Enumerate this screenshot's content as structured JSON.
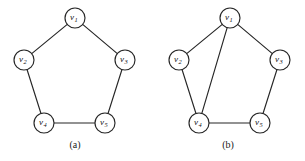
{
  "figure": {
    "background_color": "#ffffff",
    "ink_color": "#262626",
    "node_radius": 10,
    "node_fill": "#ffffff"
  },
  "chart_data": {
    "type": "diagram",
    "title": "",
    "graphs": [
      {
        "id": "a",
        "caption": "(a)",
        "caption_x": 75,
        "caption_y": 148,
        "nodes": [
          {
            "id": "v1",
            "label": "v",
            "subscript": "1",
            "x": 75,
            "y": 18
          },
          {
            "id": "v2",
            "label": "v",
            "subscript": "2",
            "x": 24,
            "y": 60
          },
          {
            "id": "v3",
            "label": "v",
            "subscript": "3",
            "x": 125,
            "y": 60
          },
          {
            "id": "v4",
            "label": "v",
            "subscript": "4",
            "x": 44,
            "y": 123
          },
          {
            "id": "v5",
            "label": "v",
            "subscript": "5",
            "x": 105,
            "y": 123
          }
        ],
        "edges": [
          {
            "from": "v1",
            "to": "v2"
          },
          {
            "from": "v1",
            "to": "v3"
          },
          {
            "from": "v2",
            "to": "v4"
          },
          {
            "from": "v3",
            "to": "v5"
          },
          {
            "from": "v4",
            "to": "v5"
          }
        ]
      },
      {
        "id": "b",
        "caption": "(b)",
        "caption_x": 228,
        "caption_y": 148,
        "nodes": [
          {
            "id": "v1",
            "label": "v",
            "subscript": "1",
            "x": 230,
            "y": 18
          },
          {
            "id": "v2",
            "label": "v",
            "subscript": "2",
            "x": 179,
            "y": 60
          },
          {
            "id": "v3",
            "label": "v",
            "subscript": "3",
            "x": 280,
            "y": 60
          },
          {
            "id": "v4",
            "label": "v",
            "subscript": "4",
            "x": 199,
            "y": 123
          },
          {
            "id": "v5",
            "label": "v",
            "subscript": "5",
            "x": 260,
            "y": 123
          }
        ],
        "edges": [
          {
            "from": "v1",
            "to": "v2"
          },
          {
            "from": "v1",
            "to": "v3"
          },
          {
            "from": "v1",
            "to": "v4"
          },
          {
            "from": "v2",
            "to": "v4"
          },
          {
            "from": "v3",
            "to": "v5"
          },
          {
            "from": "v4",
            "to": "v5"
          }
        ]
      }
    ]
  }
}
